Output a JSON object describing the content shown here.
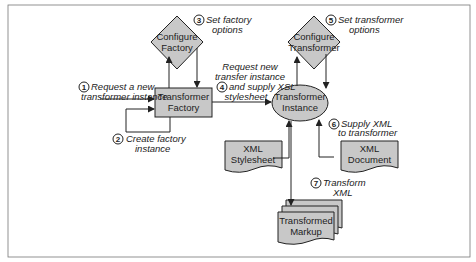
{
  "diagram": {
    "colors": {
      "node_fill": "#c8c8c8",
      "stroke": "#222222",
      "frame": "#555555",
      "background": "#ffffff"
    },
    "nodes": {
      "configure_factory": {
        "shape": "diamond",
        "line1": "Configure",
        "line2": "Factory"
      },
      "transformer_factory": {
        "shape": "rectangle",
        "line1": "Transformer",
        "line2": "Factory"
      },
      "configure_transformer": {
        "shape": "diamond",
        "line1": "Configure",
        "line2": "Transformer"
      },
      "transformer_instance": {
        "shape": "ellipse",
        "line1": "Transformer",
        "line2": "Instance"
      },
      "xml_stylesheet": {
        "shape": "document",
        "line1": "XML",
        "line2": "Stylesheet"
      },
      "xml_document": {
        "shape": "document",
        "line1": "XML",
        "line2": "Document"
      },
      "transformed_markup": {
        "shape": "multi-document",
        "line1": "Transformed",
        "line2": "Markup"
      }
    },
    "steps": [
      {
        "number": "1",
        "line1": "Request a new",
        "line2": "transformer instance"
      },
      {
        "number": "2",
        "line1": "Create factory",
        "line2": "instance"
      },
      {
        "number": "3",
        "line1": "Set factory",
        "line2": "options"
      },
      {
        "number": "4",
        "line1": "Request new",
        "line2": "transfer instance",
        "line3": "and supply XSL",
        "line4": "stylesheet"
      },
      {
        "number": "5",
        "line1": "Set transformer",
        "line2": "options"
      },
      {
        "number": "6",
        "line1": "Supply XML",
        "line2": "to transformer"
      },
      {
        "number": "7",
        "line1": "Transform",
        "line2": "XML"
      }
    ]
  }
}
